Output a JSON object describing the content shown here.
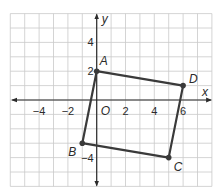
{
  "diagram": {
    "type": "coordinate-plane-quadrilateral",
    "grid": {
      "x_min": -6,
      "x_max": 8,
      "y_min": -6,
      "y_max": 6,
      "step": 1
    },
    "axes": {
      "x_label": "x",
      "y_label": "y",
      "origin_label": "O"
    },
    "x_ticks": [
      {
        "value": -4,
        "label": "−4"
      },
      {
        "value": -2,
        "label": "−2"
      },
      {
        "value": 2,
        "label": "2"
      },
      {
        "value": 4,
        "label": "4"
      },
      {
        "value": 6,
        "label": "6"
      }
    ],
    "y_ticks": [
      {
        "value": 4,
        "label": "4"
      },
      {
        "value": 2,
        "label": "2"
      },
      {
        "value": -4,
        "label": "−4"
      }
    ],
    "points": [
      {
        "name": "A",
        "x": 0,
        "y": 2
      },
      {
        "name": "D",
        "x": 6,
        "y": 1
      },
      {
        "name": "C",
        "x": 5,
        "y": -4
      },
      {
        "name": "B",
        "x": -1,
        "y": -3
      }
    ],
    "polygon_order": [
      "A",
      "D",
      "C",
      "B"
    ],
    "colors": {
      "grid": "#c9c9c9",
      "axis": "#2b2b2b",
      "shape": "#3a3a3a",
      "background": "#ffffff"
    }
  }
}
